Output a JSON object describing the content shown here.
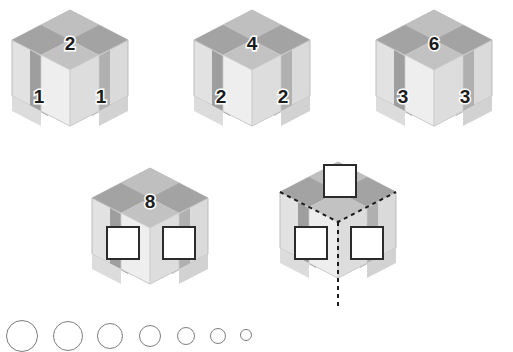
{
  "puzzle": {
    "type": "isometric-cube-number-sequence",
    "colors": {
      "top_light": "#c9c9c9",
      "top_dark": "#a3a3a3",
      "left_light": "#e2e2e2",
      "left_dark": "#9e9e9e",
      "right_light": "#dadada",
      "right_dark": "#b0b0b0",
      "column_light": "#ebebeb",
      "column_top": "#c2c2c2",
      "outline": "#bdbdbd",
      "box_fill": "#ffffff",
      "box_border": "#2b2b2b",
      "number_text": "#1c1c1c",
      "number_halo": "#ffffff",
      "dash_line": "#1c1c1c",
      "circle_stroke": "#7d7d7d"
    },
    "cubes": [
      {
        "id": "cube-1",
        "x": 8,
        "y": 8,
        "dashed": false,
        "labels": {
          "top": "2",
          "left": "1",
          "right": "1"
        },
        "boxes": {
          "top": false,
          "left": false,
          "right": false
        }
      },
      {
        "id": "cube-2",
        "x": 190,
        "y": 8,
        "dashed": false,
        "labels": {
          "top": "4",
          "left": "2",
          "right": "2"
        },
        "boxes": {
          "top": false,
          "left": false,
          "right": false
        }
      },
      {
        "id": "cube-3",
        "x": 372,
        "y": 8,
        "dashed": false,
        "labels": {
          "top": "6",
          "left": "3",
          "right": "3"
        },
        "boxes": {
          "top": false,
          "left": false,
          "right": false
        }
      },
      {
        "id": "cube-4",
        "x": 88,
        "y": 166,
        "dashed": false,
        "labels": {
          "top": "8",
          "left": "",
          "right": ""
        },
        "boxes": {
          "top": false,
          "left": true,
          "right": true
        }
      },
      {
        "id": "cube-5",
        "x": 276,
        "y": 160,
        "dashed": true,
        "labels": {
          "top": "",
          "left": "",
          "right": ""
        },
        "boxes": {
          "top": true,
          "left": true,
          "right": true
        }
      }
    ],
    "bottom_circles": [
      {
        "cx": 22,
        "cy": 326,
        "r": 16
      },
      {
        "cx": 68,
        "cy": 326,
        "r": 15
      },
      {
        "cx": 110,
        "cy": 326,
        "r": 13
      },
      {
        "cx": 150,
        "cy": 326,
        "r": 11
      },
      {
        "cx": 186,
        "cy": 327,
        "r": 9
      },
      {
        "cx": 218,
        "cy": 328,
        "r": 8
      },
      {
        "cx": 246,
        "cy": 329,
        "r": 6
      }
    ]
  }
}
